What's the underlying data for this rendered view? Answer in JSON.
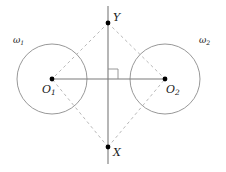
{
  "figure": {
    "type": "geometry-diagram",
    "width": 226,
    "height": 172,
    "background_color": "#ffffff"
  },
  "style": {
    "circle_stroke": "#8c8c8c",
    "solid_line_stroke": "#7a7a7a",
    "dashed_line_stroke": "#b0b0b0",
    "right_angle_stroke": "#8c8c8c",
    "point_fill": "#000000",
    "label_color": "#1a1a1a",
    "circle_stroke_width": 0.9,
    "solid_line_stroke_width": 1.1,
    "dashed_line_stroke_width": 0.9,
    "dash_pattern": "3 3",
    "point_radius": 2.4
  },
  "circles": [
    {
      "id": "omega-1",
      "label": "ω",
      "label_sub": "1",
      "cx": 52,
      "cy": 79,
      "r": 35,
      "label_x": 13,
      "label_y": 36
    },
    {
      "id": "omega-2",
      "label": "ω",
      "label_sub": "2",
      "cx": 165,
      "cy": 79,
      "r": 35,
      "label_x": 199,
      "label_y": 36
    }
  ],
  "points": [
    {
      "id": "O1",
      "label": "O",
      "label_sub": "1",
      "x": 52,
      "y": 79,
      "label_x": 42,
      "label_y": 84
    },
    {
      "id": "O2",
      "label": "O",
      "label_sub": "2",
      "x": 165,
      "y": 79,
      "label_x": 166,
      "label_y": 84
    },
    {
      "id": "Y",
      "label": "Y",
      "label_sub": "",
      "x": 108,
      "y": 23,
      "label_x": 113,
      "label_y": 12
    },
    {
      "id": "X",
      "label": "X",
      "label_sub": "",
      "x": 108,
      "y": 147,
      "label_x": 113,
      "label_y": 147
    }
  ],
  "solid_segments": [
    {
      "id": "line-XY",
      "x1": 108,
      "y1": 6,
      "x2": 108,
      "y2": 164
    },
    {
      "id": "line-O1O2",
      "x1": 52,
      "y1": 79,
      "x2": 165,
      "y2": 79
    }
  ],
  "dashed_segments": [
    {
      "id": "segment-Y-O1",
      "x1": 108,
      "y1": 23,
      "x2": 52,
      "y2": 79
    },
    {
      "id": "segment-Y-O2",
      "x1": 108,
      "y1": 23,
      "x2": 165,
      "y2": 79
    },
    {
      "id": "segment-X-O1",
      "x1": 108,
      "y1": 147,
      "x2": 52,
      "y2": 79
    },
    {
      "id": "segment-X-O2",
      "x1": 108,
      "y1": 147,
      "x2": 165,
      "y2": 79
    }
  ],
  "right_angle_marker": {
    "id": "right-angle-at-intersection",
    "vertex_x": 108,
    "vertex_y": 79,
    "size": 10,
    "path": "M 108 69 L 118 69 L 118 79"
  }
}
